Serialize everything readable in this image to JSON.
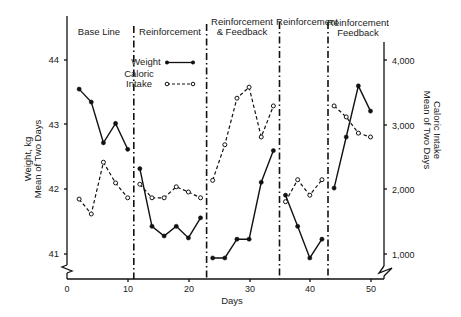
{
  "chart_data": {
    "type": "line",
    "title": "",
    "xlabel": "Days",
    "ylabel": "Weight, kg\nMean of Two Days",
    "ylabel_right": "Caloric Intake\nMean of Two Days",
    "xlim": [
      0,
      52
    ],
    "ylim": [
      40.7,
      44.7
    ],
    "ylim_right": [
      700,
      4700
    ],
    "x_ticks": [
      0,
      10,
      20,
      30,
      40,
      50
    ],
    "y_ticks": [
      41,
      42,
      43,
      44
    ],
    "y_ticks_right": [
      "1,000",
      "2,000",
      "3,000",
      "4,000"
    ],
    "y_ticks_right_values": [
      1000,
      2000,
      3000,
      4000
    ],
    "grid": false,
    "legend": {
      "position": "upper-left inside, Reinforcement phase",
      "entries": [
        {
          "label": "Weight",
          "style": "solid line, filled circle markers"
        },
        {
          "label": "Caloric\nIntake",
          "style": "dashed line, open circle markers"
        }
      ]
    },
    "phases": [
      {
        "label": "Base Line",
        "start": 0,
        "end": 11
      },
      {
        "label": "Reinforcement",
        "start": 11,
        "end": 23
      },
      {
        "label": "Reinforcement\n& Feedback",
        "start": 23,
        "end": 35
      },
      {
        "label": "Reinforcement",
        "start": 35,
        "end": 43
      },
      {
        "label": "Reinforcement\nFeedback",
        "start": 43,
        "end": 52
      }
    ],
    "phase_dividers_x": [
      11,
      23,
      35,
      43
    ],
    "series": [
      {
        "name": "Weight",
        "axis": "left",
        "segments": [
          {
            "x": [
              2,
              4,
              6,
              8,
              10
            ],
            "y": [
              43.55,
              43.35,
              42.72,
              43.02,
              42.62
            ]
          },
          {
            "x": [
              12,
              14,
              16,
              18,
              20,
              22
            ],
            "y": [
              42.32,
              41.43,
              41.28,
              41.43,
              41.25,
              41.56
            ]
          },
          {
            "x": [
              24,
              26,
              28,
              30,
              32,
              34
            ],
            "y": [
              40.94,
              40.94,
              41.23,
              41.23,
              42.11,
              42.6
            ]
          },
          {
            "x": [
              36,
              38,
              40,
              42
            ],
            "y": [
              41.91,
              41.43,
              40.94,
              41.23
            ]
          },
          {
            "x": [
              44,
              46,
              48,
              50
            ],
            "y": [
              42.02,
              42.81,
              43.6,
              43.21
            ]
          }
        ]
      },
      {
        "name": "Caloric Intake",
        "axis": "right",
        "segments": [
          {
            "x": [
              2,
              4,
              6,
              8,
              10
            ],
            "y": [
              1850,
              1620,
              2420,
              2100,
              1870
            ]
          },
          {
            "x": [
              12,
              14,
              16,
              18,
              20,
              22
            ],
            "y": [
              2080,
              1870,
              1870,
              2040,
              1960,
              1870
            ]
          },
          {
            "x": [
              24,
              26,
              28,
              30,
              32,
              34
            ],
            "y": [
              2140,
              2690,
              3410,
              3580,
              2810,
              3290
            ]
          },
          {
            "x": [
              36,
              38,
              40,
              42
            ],
            "y": [
              1810,
              2150,
              1910,
              2150
            ]
          },
          {
            "x": [
              44,
              46,
              48,
              50
            ],
            "y": [
              3290,
              3120,
              2870,
              2810
            ]
          }
        ]
      }
    ]
  },
  "labels": {
    "xlabel": "Days",
    "ylabel_line1": "Weight, kg",
    "ylabel_line2": "Mean of Two Days",
    "ylabel_right_line1": "Caloric Intake",
    "ylabel_right_line2": "Mean of Two Days",
    "legend_weight": "Weight",
    "legend_caloric_line1": "Caloric",
    "legend_caloric_line2": "Intake",
    "phase1": "Base Line",
    "phase2": "Reinforcement",
    "phase3_line1": "Reinforcement",
    "phase3_line2": "& Feedback",
    "phase4": "Reinforcement",
    "phase5_line1": "Reinforcement",
    "phase5_line2": "Feedback",
    "x_tick_0": "0",
    "x_tick_10": "10",
    "x_tick_20": "20",
    "x_tick_30": "30",
    "x_tick_40": "40",
    "x_tick_50": "50",
    "y_tick_41": "41",
    "y_tick_42": "42",
    "y_tick_43": "43",
    "y_tick_44": "44",
    "yr_tick_1000": "1,000",
    "yr_tick_2000": "2,000",
    "yr_tick_3000": "3,000",
    "yr_tick_4000": "4,000"
  }
}
